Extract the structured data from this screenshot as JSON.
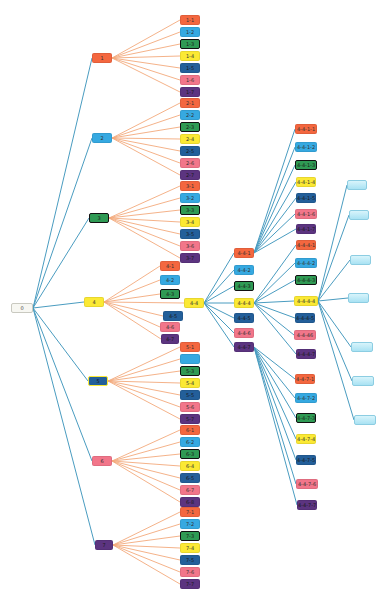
{
  "diagram": {
    "type": "tree",
    "edge_colors": {
      "root_and_deep": "#4a9cc0",
      "leaf_fan": "#f3a97c"
    },
    "palette": {
      "orange": "#f4673f",
      "sky": "#36a9e1",
      "green": "#2f9a54",
      "yellow": "#fbe934",
      "navy": "#235f9a",
      "pink": "#f2768a",
      "purple": "#5c3480",
      "root": "#f7f7f2",
      "light": "#bfeaf6"
    },
    "nodes": [
      {
        "id": "0",
        "label": "0",
        "x": 11,
        "y": 303,
        "w": 22,
        "color": "root",
        "cls": "root"
      },
      {
        "id": "1",
        "label": "1",
        "x": 92,
        "y": 53,
        "w": 20,
        "color": "orange"
      },
      {
        "id": "1-1",
        "label": "1-1",
        "x": 180,
        "y": 15,
        "w": 20,
        "color": "orange"
      },
      {
        "id": "1-2",
        "label": "1-2",
        "x": 180,
        "y": 27,
        "w": 20,
        "color": "sky"
      },
      {
        "id": "1-3",
        "label": "1-3",
        "x": 180,
        "y": 39,
        "w": 20,
        "color": "green",
        "cls": "outlined"
      },
      {
        "id": "1-4",
        "label": "1-4",
        "x": 180,
        "y": 51,
        "w": 20,
        "color": "yellow"
      },
      {
        "id": "1-5",
        "label": "1-5",
        "x": 180,
        "y": 63,
        "w": 20,
        "color": "navy"
      },
      {
        "id": "1-6",
        "label": "1-6",
        "x": 180,
        "y": 75,
        "w": 20,
        "color": "pink"
      },
      {
        "id": "1-7",
        "label": "1-7",
        "x": 180,
        "y": 87,
        "w": 20,
        "color": "purple"
      },
      {
        "id": "2",
        "label": "2",
        "x": 92,
        "y": 133,
        "w": 20,
        "color": "sky"
      },
      {
        "id": "2-1",
        "label": "2-1",
        "x": 180,
        "y": 98,
        "w": 20,
        "color": "orange"
      },
      {
        "id": "2-2",
        "label": "2-2",
        "x": 180,
        "y": 110,
        "w": 20,
        "color": "sky"
      },
      {
        "id": "2-3",
        "label": "2-3",
        "x": 180,
        "y": 122,
        "w": 20,
        "color": "green",
        "cls": "outlined"
      },
      {
        "id": "2-4",
        "label": "2-4",
        "x": 180,
        "y": 134,
        "w": 20,
        "color": "yellow"
      },
      {
        "id": "2-5",
        "label": "2-5",
        "x": 180,
        "y": 146,
        "w": 20,
        "color": "navy"
      },
      {
        "id": "2-6",
        "label": "2-6",
        "x": 180,
        "y": 158,
        "w": 20,
        "color": "pink"
      },
      {
        "id": "2-7",
        "label": "2-7",
        "x": 180,
        "y": 170,
        "w": 20,
        "color": "purple"
      },
      {
        "id": "3",
        "label": "3",
        "x": 89,
        "y": 213,
        "w": 20,
        "color": "green",
        "cls": "outlined"
      },
      {
        "id": "3-1",
        "label": "3-1",
        "x": 180,
        "y": 181,
        "w": 20,
        "color": "orange"
      },
      {
        "id": "3-2",
        "label": "3-2",
        "x": 180,
        "y": 193,
        "w": 20,
        "color": "sky"
      },
      {
        "id": "3-3",
        "label": "3-3",
        "x": 180,
        "y": 205,
        "w": 20,
        "color": "green",
        "cls": "outlined"
      },
      {
        "id": "3-4",
        "label": "3-4",
        "x": 180,
        "y": 217,
        "w": 20,
        "color": "yellow"
      },
      {
        "id": "3-5",
        "label": "3-5",
        "x": 180,
        "y": 229,
        "w": 20,
        "color": "navy"
      },
      {
        "id": "3-6",
        "label": "3-6",
        "x": 180,
        "y": 241,
        "w": 20,
        "color": "pink"
      },
      {
        "id": "3-7",
        "label": "3-7",
        "x": 180,
        "y": 253,
        "w": 20,
        "color": "purple"
      },
      {
        "id": "4",
        "label": "4",
        "x": 84,
        "y": 297,
        "w": 20,
        "color": "yellow"
      },
      {
        "id": "4-1",
        "label": "4-1",
        "x": 160,
        "y": 261,
        "w": 20,
        "color": "orange"
      },
      {
        "id": "4-2",
        "label": "4-2",
        "x": 160,
        "y": 275,
        "w": 20,
        "color": "sky"
      },
      {
        "id": "4-3",
        "label": "4-3",
        "x": 160,
        "y": 289,
        "w": 20,
        "color": "green",
        "cls": "outlined"
      },
      {
        "id": "4-4",
        "label": "4-4",
        "x": 184,
        "y": 298,
        "w": 20,
        "color": "yellow"
      },
      {
        "id": "4-5",
        "label": "4-5",
        "x": 163,
        "y": 311,
        "w": 20,
        "color": "navy"
      },
      {
        "id": "4-6",
        "label": "4-6",
        "x": 160,
        "y": 322,
        "w": 20,
        "color": "pink"
      },
      {
        "id": "4-7",
        "label": "4-7",
        "x": 161,
        "y": 334,
        "w": 18,
        "color": "purple"
      },
      {
        "id": "4-4-1",
        "label": "4-4-1",
        "x": 234,
        "y": 248,
        "w": 20,
        "color": "orange"
      },
      {
        "id": "4-4-2",
        "label": "4-4-2",
        "x": 234,
        "y": 265,
        "w": 20,
        "color": "sky"
      },
      {
        "id": "4-4-3",
        "label": "4-4-3",
        "x": 234,
        "y": 281,
        "w": 20,
        "color": "green",
        "cls": "outlined"
      },
      {
        "id": "4-4-4",
        "label": "4-4-4",
        "x": 234,
        "y": 298,
        "w": 20,
        "color": "yellow"
      },
      {
        "id": "4-4-5",
        "label": "4-4-5",
        "x": 234,
        "y": 313,
        "w": 20,
        "color": "navy"
      },
      {
        "id": "4-4-6",
        "label": "4-4-6",
        "x": 234,
        "y": 328,
        "w": 20,
        "color": "pink"
      },
      {
        "id": "4-4-7",
        "label": "4-4-7",
        "x": 234,
        "y": 342,
        "w": 20,
        "color": "purple"
      },
      {
        "id": "4-4-1-1",
        "label": "4-4-1-1",
        "x": 295,
        "y": 124,
        "w": 22,
        "color": "orange"
      },
      {
        "id": "4-4-1-2",
        "label": "4-4-1-2",
        "x": 295,
        "y": 142,
        "w": 22,
        "color": "sky"
      },
      {
        "id": "4-4-1-3",
        "label": "4-4-1-3",
        "x": 295,
        "y": 160,
        "w": 22,
        "color": "green",
        "cls": "outlined"
      },
      {
        "id": "4-4-1-4",
        "label": "4-4-1-4",
        "x": 296,
        "y": 177,
        "w": 20,
        "color": "yellow"
      },
      {
        "id": "4-4-1-5",
        "label": "4-4-1-5",
        "x": 296,
        "y": 193,
        "w": 20,
        "color": "navy"
      },
      {
        "id": "4-4-1-6",
        "label": "4-4-1-6",
        "x": 295,
        "y": 209,
        "w": 22,
        "color": "pink"
      },
      {
        "id": "4-4-1-7",
        "label": "4-4-1-7",
        "x": 296,
        "y": 224,
        "w": 20,
        "color": "purple"
      },
      {
        "id": "4-4-4-1",
        "label": "4-4-4-1",
        "x": 296,
        "y": 240,
        "w": 20,
        "color": "orange"
      },
      {
        "id": "4-4-4-2",
        "label": "4-4-4-2",
        "x": 295,
        "y": 258,
        "w": 22,
        "color": "sky"
      },
      {
        "id": "4-4-4-3",
        "label": "4-4-4-3",
        "x": 295,
        "y": 275,
        "w": 22,
        "color": "green",
        "cls": "outlined"
      },
      {
        "id": "4-4-4-4",
        "label": "4-4-4-4",
        "x": 294,
        "y": 296,
        "w": 24,
        "color": "yellow"
      },
      {
        "id": "4-4-4-5",
        "label": "4-4-4-5",
        "x": 295,
        "y": 313,
        "w": 20,
        "color": "navy"
      },
      {
        "id": "4-4-4-6",
        "label": "4-4-46",
        "x": 294,
        "y": 330,
        "w": 22,
        "color": "pink"
      },
      {
        "id": "4-4-4-7",
        "label": "4-4-4-7",
        "x": 296,
        "y": 349,
        "w": 20,
        "color": "purple"
      },
      {
        "id": "4-4-7-1",
        "label": "4-4-7-1",
        "x": 295,
        "y": 374,
        "w": 20,
        "color": "orange"
      },
      {
        "id": "4-4-7-2",
        "label": "4-4-7-2",
        "x": 295,
        "y": 393,
        "w": 22,
        "color": "sky"
      },
      {
        "id": "4-4-7-3",
        "label": "4-4-7-3",
        "x": 296,
        "y": 413,
        "w": 20,
        "color": "green",
        "cls": "outlined"
      },
      {
        "id": "4-4-7-4",
        "label": "4-4-7-4",
        "x": 296,
        "y": 434,
        "w": 20,
        "color": "yellow"
      },
      {
        "id": "4-4-7-5",
        "label": "4-4-7-5",
        "x": 296,
        "y": 455,
        "w": 20,
        "color": "navy"
      },
      {
        "id": "4-4-7-6",
        "label": "4-4-7-6",
        "x": 296,
        "y": 479,
        "w": 22,
        "color": "pink"
      },
      {
        "id": "4-4-7-7",
        "label": "4-4-7-7",
        "x": 297,
        "y": 500,
        "w": 20,
        "color": "purple"
      },
      {
        "id": "4-4-4-4-1",
        "label": "",
        "x": 347,
        "y": 180,
        "w": 20,
        "color": "light",
        "cls": "light"
      },
      {
        "id": "4-4-4-4-2",
        "label": "",
        "x": 349,
        "y": 210,
        "w": 20,
        "color": "light",
        "cls": "light"
      },
      {
        "id": "4-4-4-4-3",
        "label": "",
        "x": 350,
        "y": 255,
        "w": 21,
        "color": "light",
        "cls": "light"
      },
      {
        "id": "4-4-4-4-4",
        "label": "",
        "x": 348,
        "y": 293,
        "w": 21,
        "color": "light",
        "cls": "light"
      },
      {
        "id": "4-4-4-4-5",
        "label": "",
        "x": 351,
        "y": 342,
        "w": 22,
        "color": "light",
        "cls": "light"
      },
      {
        "id": "4-4-4-4-6",
        "label": "",
        "x": 352,
        "y": 376,
        "w": 22,
        "color": "light",
        "cls": "light"
      },
      {
        "id": "4-4-4-4-7",
        "label": "",
        "x": 354,
        "y": 415,
        "w": 22,
        "color": "light",
        "cls": "light"
      },
      {
        "id": "5",
        "label": "5",
        "x": 88,
        "y": 376,
        "w": 20,
        "color": "navy",
        "cls": "outlined-yellow"
      },
      {
        "id": "5-1",
        "label": "5-1",
        "x": 180,
        "y": 342,
        "w": 20,
        "color": "orange"
      },
      {
        "id": "5-2",
        "label": "",
        "x": 180,
        "y": 354,
        "w": 20,
        "color": "sky"
      },
      {
        "id": "5-3",
        "label": "5-3",
        "x": 180,
        "y": 366,
        "w": 20,
        "color": "green",
        "cls": "outlined"
      },
      {
        "id": "5-4",
        "label": "5-4",
        "x": 180,
        "y": 378,
        "w": 20,
        "color": "yellow"
      },
      {
        "id": "5-5",
        "label": "5-5",
        "x": 180,
        "y": 390,
        "w": 20,
        "color": "navy"
      },
      {
        "id": "5-6",
        "label": "5-6",
        "x": 180,
        "y": 402,
        "w": 20,
        "color": "pink"
      },
      {
        "id": "5-7",
        "label": "5-7",
        "x": 180,
        "y": 414,
        "w": 20,
        "color": "purple"
      },
      {
        "id": "6",
        "label": "6",
        "x": 92,
        "y": 456,
        "w": 20,
        "color": "pink"
      },
      {
        "id": "6-1",
        "label": "6-1",
        "x": 180,
        "y": 425,
        "w": 20,
        "color": "orange"
      },
      {
        "id": "6-2",
        "label": "6-2",
        "x": 180,
        "y": 437,
        "w": 20,
        "color": "sky"
      },
      {
        "id": "6-3",
        "label": "6-3",
        "x": 180,
        "y": 449,
        "w": 20,
        "color": "green",
        "cls": "outlined"
      },
      {
        "id": "6-4",
        "label": "6-4",
        "x": 180,
        "y": 461,
        "w": 20,
        "color": "yellow"
      },
      {
        "id": "6-5",
        "label": "6-5",
        "x": 180,
        "y": 473,
        "w": 20,
        "color": "navy"
      },
      {
        "id": "6-7",
        "label": "6-7",
        "x": 180,
        "y": 485,
        "w": 20,
        "color": "pink"
      },
      {
        "id": "6-8",
        "label": "6-8",
        "x": 180,
        "y": 497,
        "w": 20,
        "color": "purple"
      },
      {
        "id": "7",
        "label": "7",
        "x": 95,
        "y": 540,
        "w": 18,
        "color": "purple"
      },
      {
        "id": "7-1",
        "label": "7-1",
        "x": 180,
        "y": 507,
        "w": 20,
        "color": "orange"
      },
      {
        "id": "7-2",
        "label": "7-2",
        "x": 180,
        "y": 519,
        "w": 20,
        "color": "sky"
      },
      {
        "id": "7-3",
        "label": "7-3",
        "x": 180,
        "y": 531,
        "w": 20,
        "color": "green",
        "cls": "outlined"
      },
      {
        "id": "7-4",
        "label": "7-4",
        "x": 180,
        "y": 543,
        "w": 20,
        "color": "yellow"
      },
      {
        "id": "7-5",
        "label": "7-5",
        "x": 180,
        "y": 555,
        "w": 20,
        "color": "navy"
      },
      {
        "id": "7-6",
        "label": "7-6",
        "x": 180,
        "y": 567,
        "w": 20,
        "color": "pink"
      },
      {
        "id": "7-7",
        "label": "7-7",
        "x": 180,
        "y": 579,
        "w": 20,
        "color": "purple"
      }
    ],
    "edges": [
      [
        "0",
        "1",
        "blue"
      ],
      [
        "0",
        "2",
        "blue"
      ],
      [
        "0",
        "3",
        "blue"
      ],
      [
        "0",
        "4",
        "blue"
      ],
      [
        "0",
        "5",
        "blue"
      ],
      [
        "0",
        "6",
        "blue"
      ],
      [
        "0",
        "7",
        "blue"
      ],
      [
        "1",
        "1-1",
        "orange"
      ],
      [
        "1",
        "1-2",
        "orange"
      ],
      [
        "1",
        "1-3",
        "orange"
      ],
      [
        "1",
        "1-4",
        "orange"
      ],
      [
        "1",
        "1-5",
        "orange"
      ],
      [
        "1",
        "1-6",
        "orange"
      ],
      [
        "1",
        "1-7",
        "orange"
      ],
      [
        "2",
        "2-1",
        "orange"
      ],
      [
        "2",
        "2-2",
        "orange"
      ],
      [
        "2",
        "2-3",
        "orange"
      ],
      [
        "2",
        "2-4",
        "orange"
      ],
      [
        "2",
        "2-5",
        "orange"
      ],
      [
        "2",
        "2-6",
        "orange"
      ],
      [
        "2",
        "2-7",
        "orange"
      ],
      [
        "3",
        "3-1",
        "orange"
      ],
      [
        "3",
        "3-2",
        "orange"
      ],
      [
        "3",
        "3-3",
        "orange"
      ],
      [
        "3",
        "3-4",
        "orange"
      ],
      [
        "3",
        "3-5",
        "orange"
      ],
      [
        "3",
        "3-6",
        "orange"
      ],
      [
        "3",
        "3-7",
        "orange"
      ],
      [
        "4",
        "4-1",
        "orange"
      ],
      [
        "4",
        "4-2",
        "orange"
      ],
      [
        "4",
        "4-3",
        "orange"
      ],
      [
        "4",
        "4-4",
        "orange"
      ],
      [
        "4",
        "4-5",
        "orange"
      ],
      [
        "4",
        "4-6",
        "orange"
      ],
      [
        "4",
        "4-7",
        "orange"
      ],
      [
        "5",
        "5-1",
        "orange"
      ],
      [
        "5",
        "5-2",
        "orange"
      ],
      [
        "5",
        "5-3",
        "orange"
      ],
      [
        "5",
        "5-4",
        "orange"
      ],
      [
        "5",
        "5-5",
        "orange"
      ],
      [
        "5",
        "5-6",
        "orange"
      ],
      [
        "5",
        "5-7",
        "orange"
      ],
      [
        "6",
        "6-1",
        "orange"
      ],
      [
        "6",
        "6-2",
        "orange"
      ],
      [
        "6",
        "6-3",
        "orange"
      ],
      [
        "6",
        "6-4",
        "orange"
      ],
      [
        "6",
        "6-5",
        "orange"
      ],
      [
        "6",
        "6-7",
        "orange"
      ],
      [
        "6",
        "6-8",
        "orange"
      ],
      [
        "7",
        "7-1",
        "orange"
      ],
      [
        "7",
        "7-2",
        "orange"
      ],
      [
        "7",
        "7-3",
        "orange"
      ],
      [
        "7",
        "7-4",
        "orange"
      ],
      [
        "7",
        "7-5",
        "orange"
      ],
      [
        "7",
        "7-6",
        "orange"
      ],
      [
        "7",
        "7-7",
        "orange"
      ],
      [
        "4-4",
        "4-4-1",
        "blue"
      ],
      [
        "4-4",
        "4-4-2",
        "blue"
      ],
      [
        "4-4",
        "4-4-3",
        "blue"
      ],
      [
        "4-4",
        "4-4-4",
        "blue"
      ],
      [
        "4-4",
        "4-4-5",
        "blue"
      ],
      [
        "4-4",
        "4-4-6",
        "blue"
      ],
      [
        "4-4",
        "4-4-7",
        "blue"
      ],
      [
        "4-4-1",
        "4-4-1-1",
        "blue"
      ],
      [
        "4-4-1",
        "4-4-1-2",
        "blue"
      ],
      [
        "4-4-1",
        "4-4-1-3",
        "blue"
      ],
      [
        "4-4-1",
        "4-4-1-4",
        "blue"
      ],
      [
        "4-4-1",
        "4-4-1-5",
        "blue"
      ],
      [
        "4-4-1",
        "4-4-1-6",
        "blue"
      ],
      [
        "4-4-1",
        "4-4-1-7",
        "blue"
      ],
      [
        "4-4-4",
        "4-4-4-1",
        "blue"
      ],
      [
        "4-4-4",
        "4-4-4-2",
        "blue"
      ],
      [
        "4-4-4",
        "4-4-4-3",
        "blue"
      ],
      [
        "4-4-4",
        "4-4-4-4",
        "blue"
      ],
      [
        "4-4-4",
        "4-4-4-5",
        "blue"
      ],
      [
        "4-4-4",
        "4-4-4-6",
        "blue"
      ],
      [
        "4-4-4",
        "4-4-4-7",
        "blue"
      ],
      [
        "4-4-7",
        "4-4-7-1",
        "blue"
      ],
      [
        "4-4-7",
        "4-4-7-2",
        "blue"
      ],
      [
        "4-4-7",
        "4-4-7-3",
        "blue"
      ],
      [
        "4-4-7",
        "4-4-7-4",
        "blue"
      ],
      [
        "4-4-7",
        "4-4-7-5",
        "blue"
      ],
      [
        "4-4-7",
        "4-4-7-6",
        "blue"
      ],
      [
        "4-4-7",
        "4-4-7-7",
        "blue"
      ],
      [
        "4-4-4-4",
        "4-4-4-4-1",
        "blue"
      ],
      [
        "4-4-4-4",
        "4-4-4-4-2",
        "blue"
      ],
      [
        "4-4-4-4",
        "4-4-4-4-3",
        "blue"
      ],
      [
        "4-4-4-4",
        "4-4-4-4-4",
        "blue"
      ],
      [
        "4-4-4-4",
        "4-4-4-4-5",
        "blue"
      ],
      [
        "4-4-4-4",
        "4-4-4-4-6",
        "blue"
      ],
      [
        "4-4-4-4",
        "4-4-4-4-7",
        "blue"
      ]
    ]
  }
}
